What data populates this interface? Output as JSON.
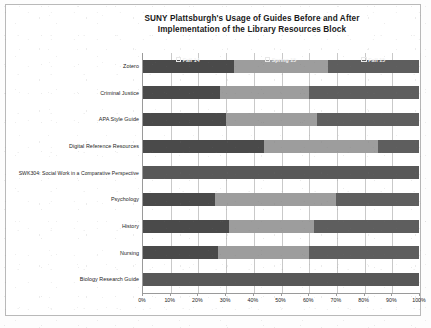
{
  "chart_data": {
    "type": "bar",
    "orientation": "horizontal",
    "stacked": true,
    "normalized_percent": true,
    "title": "SUNY Plattsburgh's Usage of Guides Before and After Implementation of the Library Resources Block",
    "title_line1": "SUNY Plattsburgh's Usage of Guides Before and After",
    "title_line2": "Implementation of the Library Resources Block",
    "xlabel": "",
    "ylabel": "",
    "xlim": [
      0,
      100
    ],
    "grid": true,
    "legend_position": "inside-top-row",
    "categories": [
      "Zotero",
      "Criminal Justice",
      "APA Style Guide",
      "Digital Reference Resources",
      "SWK304: Social Work in a Comparative Perspective",
      "Psychology",
      "History",
      "Nursing",
      "Biology Research Guide"
    ],
    "series": [
      {
        "name": "Fall 14",
        "color": "#4a4a4a",
        "values": [
          33,
          28,
          30,
          44,
          0,
          26,
          31,
          27,
          0
        ]
      },
      {
        "name": "Spring 15",
        "color": "#9d9d9d",
        "values": [
          34,
          32,
          33,
          41,
          0,
          44,
          31,
          33,
          0
        ]
      },
      {
        "name": "Fall 15",
        "color": "#5e5e5e",
        "values": [
          33,
          40,
          37,
          15,
          100,
          30,
          38,
          40,
          100
        ]
      }
    ],
    "xticks": [
      0,
      10,
      20,
      30,
      40,
      50,
      60,
      70,
      80,
      90,
      100
    ],
    "xticklabels": [
      "0%",
      "10%",
      "20%",
      "30%",
      "40%",
      "50%",
      "60%",
      "70%",
      "80%",
      "90%",
      "100%"
    ]
  },
  "colors": {
    "series_fall14": "#4a4a4a",
    "series_spring15": "#9d9d9d",
    "series_fall15": "#5e5e5e",
    "gridline": "#c9c9c9",
    "axis": "#9a9a9a",
    "frame": "#b9b9b9",
    "text": "#1c1c1c",
    "page": "#fdfdfd"
  }
}
